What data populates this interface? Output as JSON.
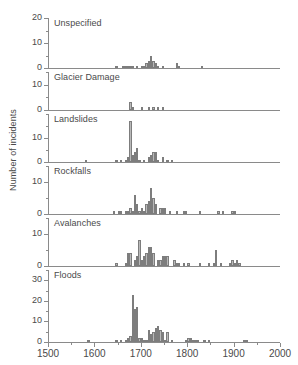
{
  "chart_data": {
    "type": "bar",
    "title": "",
    "subtitle": "",
    "xlabel": "",
    "ylabel": "Number of incidents",
    "xlim": [
      1500,
      2000
    ],
    "xticks": [
      1500,
      1600,
      1700,
      1800,
      1900,
      2000
    ],
    "xtick_labels": [
      "1500",
      "1600",
      "1700",
      "1800",
      "1900",
      "2000"
    ],
    "grid": false,
    "legend": "none",
    "bin_width": 5,
    "panels": [
      {
        "name": "Unspecified",
        "label": "Unspecified",
        "ylim": [
          0,
          20
        ],
        "yticks": [
          0,
          10,
          20
        ],
        "ytick_labels": [
          "0",
          "10",
          "20"
        ],
        "yminor": [
          5,
          15
        ],
        "x": [
          1645,
          1660,
          1665,
          1670,
          1675,
          1680,
          1690,
          1700,
          1705,
          1710,
          1715,
          1720,
          1725,
          1730,
          1735,
          1745,
          1775,
          1780,
          1830
        ],
        "values": [
          1,
          1,
          1,
          1,
          1,
          1,
          1,
          1,
          1,
          2,
          3,
          5,
          3,
          2,
          1,
          1,
          2,
          1,
          1
        ]
      },
      {
        "name": "Glacier Damage",
        "label": "Glacier Damage",
        "ylim": [
          0,
          15
        ],
        "yticks": [
          0,
          10
        ],
        "ytick_labels": [
          "0",
          "10"
        ],
        "yminor": [
          5,
          15
        ],
        "x": [
          1675,
          1680,
          1700,
          1715,
          1725,
          1735,
          1745
        ],
        "values": [
          3,
          1,
          1,
          1,
          1,
          1,
          1
        ]
      },
      {
        "name": "Landslides",
        "label": "Landslides",
        "ylim": [
          0,
          20
        ],
        "yticks": [
          0,
          10
        ],
        "ytick_labels": [
          "0",
          "10"
        ],
        "yminor": [
          5,
          15,
          20
        ],
        "x": [
          1580,
          1645,
          1655,
          1665,
          1670,
          1675,
          1680,
          1685,
          1690,
          1695,
          1705,
          1715,
          1720,
          1725,
          1730,
          1735,
          1745,
          1755,
          1765
        ],
        "values": [
          1,
          1,
          1,
          1,
          2,
          17,
          3,
          4,
          6,
          1,
          1,
          2,
          3,
          4,
          4,
          1,
          2,
          1,
          1
        ]
      },
      {
        "name": "Rockfalls",
        "label": "Rockfalls",
        "ylim": [
          0,
          15
        ],
        "yticks": [
          0,
          10
        ],
        "ytick_labels": [
          "0",
          "10"
        ],
        "yminor": [
          5,
          15
        ],
        "x": [
          1640,
          1650,
          1655,
          1665,
          1670,
          1675,
          1680,
          1685,
          1690,
          1695,
          1700,
          1705,
          1710,
          1715,
          1720,
          1725,
          1730,
          1740,
          1745,
          1750,
          1760,
          1775,
          1790,
          1795,
          1825,
          1865,
          1875,
          1895,
          1900
        ],
        "values": [
          1,
          1,
          1,
          1,
          1,
          2,
          1,
          6,
          3,
          1,
          2,
          1,
          3,
          4,
          8,
          5,
          3,
          2,
          2,
          2,
          1,
          1,
          1,
          1,
          1,
          1,
          1,
          1,
          1
        ]
      },
      {
        "name": "Avalanches",
        "label": "Avalanches",
        "ylim": [
          0,
          15
        ],
        "yticks": [
          0,
          10
        ],
        "ytick_labels": [
          "0",
          "10"
        ],
        "yminor": [
          5,
          15
        ],
        "x": [
          1645,
          1665,
          1670,
          1675,
          1685,
          1690,
          1695,
          1700,
          1705,
          1710,
          1715,
          1720,
          1725,
          1735,
          1740,
          1745,
          1750,
          1755,
          1770,
          1775,
          1780,
          1790,
          1800,
          1825,
          1845,
          1855,
          1860,
          1870,
          1890,
          1895,
          1900,
          1905,
          1910
        ],
        "values": [
          1,
          1,
          4,
          4,
          2,
          3,
          8,
          2,
          3,
          4,
          6,
          6,
          4,
          2,
          2,
          3,
          3,
          3,
          2,
          1,
          1,
          1,
          1,
          1,
          1,
          1,
          5,
          1,
          1,
          2,
          1,
          2,
          1
        ]
      },
      {
        "name": "Floods",
        "label": "Floods",
        "ylim": [
          0,
          35
        ],
        "yticks": [
          0,
          10,
          20,
          30
        ],
        "ytick_labels": [
          "0",
          "10",
          "20",
          "30"
        ],
        "yminor": [
          5,
          15,
          25,
          35
        ],
        "x": [
          1585,
          1645,
          1655,
          1665,
          1670,
          1675,
          1680,
          1685,
          1690,
          1695,
          1700,
          1705,
          1710,
          1715,
          1720,
          1725,
          1730,
          1735,
          1740,
          1745,
          1750,
          1755,
          1765,
          1795,
          1800,
          1805,
          1810,
          1815,
          1820,
          1835,
          1845,
          1920,
          1925
        ],
        "values": [
          1,
          1,
          1,
          1,
          2,
          3,
          23,
          16,
          17,
          2,
          2,
          1,
          1,
          6,
          4,
          5,
          7,
          8,
          6,
          5,
          1,
          5,
          1,
          1,
          2,
          2,
          1,
          1,
          1,
          1,
          1,
          1,
          1
        ]
      }
    ]
  }
}
